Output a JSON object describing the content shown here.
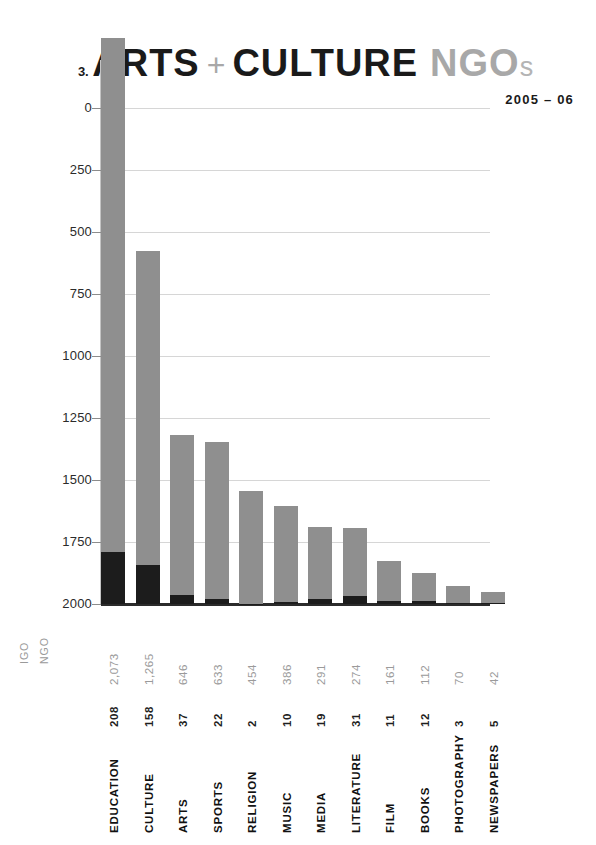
{
  "header": {
    "index": "3.",
    "title_main": "ARTS",
    "plus": "+",
    "title_main2": "CULTURE",
    "title_ngo": "NGO",
    "title_ngo_suffix": "s",
    "subtitle": "2005 – 06"
  },
  "legend": {
    "igo_label": "IGO",
    "ngo_label": "NGO",
    "igo_color": "#1c1c1c",
    "ngo_color": "#8f8f8f"
  },
  "axis": {
    "y_ticks": [
      "2000",
      "1750",
      "1500",
      "1250",
      "1000",
      "750",
      "500",
      "250",
      "0"
    ]
  },
  "chart_data": {
    "type": "bar",
    "title": "3. ARTS + CULTURE NGOs",
    "subtitle": "2005 – 06",
    "xlabel": "",
    "ylabel": "",
    "ylim": [
      0,
      2000
    ],
    "ytick_values": [
      0,
      250,
      500,
      750,
      1000,
      1250,
      1500,
      1750,
      2000
    ],
    "grid": true,
    "legend_position": "left-bottom",
    "stacked": true,
    "categories": [
      "EDUCATION",
      "CULTURE",
      "ARTS",
      "SPORTS",
      "RELIGION",
      "MUSIC",
      "MEDIA",
      "LITERATURE",
      "FILM",
      "BOOKS",
      "PHOTOGRAPHY",
      "NEWSPAPERS"
    ],
    "series": [
      {
        "name": "IGO",
        "color": "#1c1c1c",
        "values": [
          208,
          158,
          37,
          22,
          2,
          10,
          19,
          31,
          11,
          12,
          3,
          5
        ],
        "labels": [
          "208",
          "158",
          "37",
          "22",
          "2",
          "10",
          "19",
          "31",
          "11",
          "12",
          "3",
          "5"
        ]
      },
      {
        "name": "NGO",
        "color": "#8f8f8f",
        "values": [
          2073,
          1265,
          646,
          633,
          454,
          386,
          291,
          274,
          161,
          112,
          70,
          42
        ],
        "labels": [
          "2,073",
          "1,265",
          "646",
          "633",
          "454",
          "386",
          "291",
          "274",
          "161",
          "112",
          "70",
          "42"
        ]
      }
    ],
    "totals": [
      2281,
      1423,
      683,
      655,
      456,
      396,
      310,
      305,
      172,
      124,
      73,
      47
    ]
  }
}
